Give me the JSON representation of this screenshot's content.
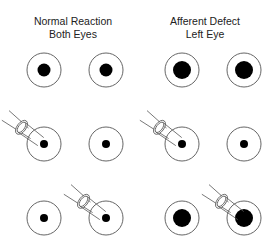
{
  "columns": [
    {
      "title_line1": "Normal Reaction",
      "title_line2": "Both Eyes"
    },
    {
      "title_line1": "Afferent Defect",
      "title_line2": "Left Eye"
    }
  ],
  "colors": {
    "stroke": "#555555",
    "pupil": "#000000",
    "background": "#ffffff"
  },
  "rows": [
    {
      "name": "baseline",
      "light": "none",
      "normal": {
        "right_pupil": "medium",
        "left_pupil": "medium"
      },
      "afferent": {
        "right_pupil": "large",
        "left_pupil": "large"
      }
    },
    {
      "name": "light-right-eye",
      "light": "right",
      "normal": {
        "right_pupil": "small",
        "left_pupil": "small"
      },
      "afferent": {
        "right_pupil": "small",
        "left_pupil": "small"
      }
    },
    {
      "name": "light-left-eye",
      "light": "left",
      "normal": {
        "right_pupil": "small",
        "left_pupil": "small"
      },
      "afferent": {
        "right_pupil": "large",
        "left_pupil": "large"
      }
    }
  ]
}
